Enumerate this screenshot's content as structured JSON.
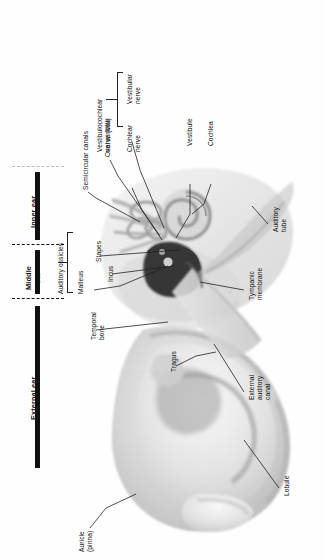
{
  "figure": {
    "orientation": "rotated-90-ccw",
    "background": "#ffffff",
    "line_color": "#222222",
    "bar_color": "#111111"
  },
  "regions": [
    {
      "id": "inner",
      "label": "Inner ear"
    },
    {
      "id": "middle",
      "label": "Middle\near"
    },
    {
      "id": "external",
      "label": "External ear"
    }
  ],
  "brackets": [
    {
      "id": "vestibulocochlear",
      "label": "Vestibulocochlear\nnerve (VIII)",
      "members": [
        "Vestibular\nnerve",
        "Cochlear\nnerve"
      ]
    },
    {
      "id": "ossicles",
      "label": "Auditory ossicles",
      "members": [
        "Stapes",
        "Incus",
        "Malleus"
      ]
    }
  ],
  "labels": [
    {
      "id": "semicircular-canals",
      "text": "Semicircular canals"
    },
    {
      "id": "oval-window",
      "text": "Oval window"
    },
    {
      "id": "vestibular-nerve",
      "text": "Vestibular\nnerve"
    },
    {
      "id": "cochlear-nerve",
      "text": "Cochlear\nnerve"
    },
    {
      "id": "vestibulocochlear-nerve",
      "text": "Vestibulocochlear\nnerve (VIII)"
    },
    {
      "id": "vestibule",
      "text": "Vestibule"
    },
    {
      "id": "cochlea",
      "text": "Cochlea"
    },
    {
      "id": "auditory-tube",
      "text": "Auditory\ntube"
    },
    {
      "id": "tympanic-membrane",
      "text": "Tympanic\nmembrane"
    },
    {
      "id": "auditory-ossicles",
      "text": "Auditory ossicles"
    },
    {
      "id": "stapes",
      "text": "Stapes"
    },
    {
      "id": "incus",
      "text": "Incus"
    },
    {
      "id": "malleus",
      "text": "Malleus"
    },
    {
      "id": "temporal-bone",
      "text": "Temporal\nbone"
    },
    {
      "id": "tragus",
      "text": "Tragus"
    },
    {
      "id": "external-auditory-canal",
      "text": "External\nauditory\ncanal"
    },
    {
      "id": "lobule",
      "text": "Lobule"
    },
    {
      "id": "auricle-pinna",
      "text": "Auricle\n(pinna)"
    },
    {
      "id": "inner-ear",
      "text": "Inner ear"
    },
    {
      "id": "middle-ear",
      "text": "Middle\near"
    },
    {
      "id": "external-ear",
      "text": "External ear"
    }
  ]
}
